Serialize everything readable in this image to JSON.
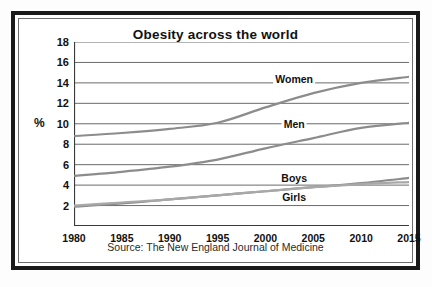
{
  "chart_data": {
    "type": "line",
    "title": "Obesity across the world",
    "xlabel": "",
    "ylabel": "%",
    "xlim": [
      1980,
      2015
    ],
    "ylim": [
      0,
      18
    ],
    "yticks": [
      18,
      16,
      14,
      12,
      10,
      8,
      6,
      4,
      2
    ],
    "xticks": [
      1980,
      1985,
      1990,
      1995,
      2000,
      2005,
      2010,
      2015
    ],
    "grid": true,
    "legend_position": "inline-labels",
    "source": "Source: The New England Journal of Medicine",
    "x": [
      1980,
      1985,
      1990,
      1995,
      2000,
      2005,
      2010,
      2015
    ],
    "series": [
      {
        "name": "Women",
        "values": [
          8.8,
          9.1,
          9.5,
          10.1,
          11.6,
          13.0,
          14.0,
          14.6
        ],
        "color": "#8c8c8c"
      },
      {
        "name": "Men",
        "values": [
          4.9,
          5.3,
          5.8,
          6.5,
          7.6,
          8.6,
          9.6,
          10.1
        ],
        "color": "#8c8c8c"
      },
      {
        "name": "Boys",
        "values": [
          1.9,
          2.2,
          2.6,
          3.0,
          3.4,
          3.8,
          4.2,
          4.7
        ],
        "color": "#8c8c8c"
      },
      {
        "name": "Girls",
        "values": [
          2.0,
          2.3,
          2.6,
          3.0,
          3.4,
          3.8,
          4.1,
          4.3
        ],
        "color": "#a8a8a8"
      }
    ],
    "annotations": [
      {
        "text": "Women",
        "x": 2003,
        "y": 14.3
      },
      {
        "text": "Men",
        "x": 2003,
        "y": 9.9
      },
      {
        "text": "Boys",
        "x": 2003,
        "y": 4.6
      },
      {
        "text": "Girls",
        "x": 2003,
        "y": 2.7
      }
    ]
  },
  "colors": {
    "frame": "#1a1a1a",
    "grid": "#5a5a5a",
    "axis": "#3a3a3a",
    "line": "#8c8c8c",
    "text": "#111111",
    "background": "#ffffff"
  }
}
